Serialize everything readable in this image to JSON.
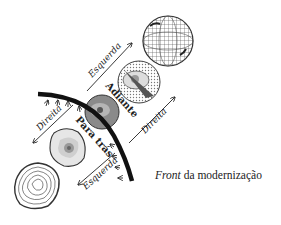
{
  "diagram": {
    "caption": {
      "italic": "Front",
      "rest": " da modernização"
    },
    "labels": {
      "upper_left_arrow": "Esquerda",
      "left_arrow": "Direita",
      "lower_arrow": "Esquerda",
      "right_arrow": "Direita",
      "forward": "Adiante",
      "backward": "Para trás"
    },
    "objects": [
      {
        "id": "globe-wireframe",
        "description": "wireframe globe"
      },
      {
        "id": "half-globe-cut",
        "description": "half globe with cut section"
      },
      {
        "id": "sphere-shaded",
        "description": "shaded sphere crossing the front"
      },
      {
        "id": "flat-cell",
        "description": "flattened cell-like disk"
      },
      {
        "id": "contour-disk",
        "description": "contour-line disk"
      }
    ],
    "colors": {
      "front_line": "#111111",
      "text": "#222222",
      "background": "#ffffff"
    }
  }
}
